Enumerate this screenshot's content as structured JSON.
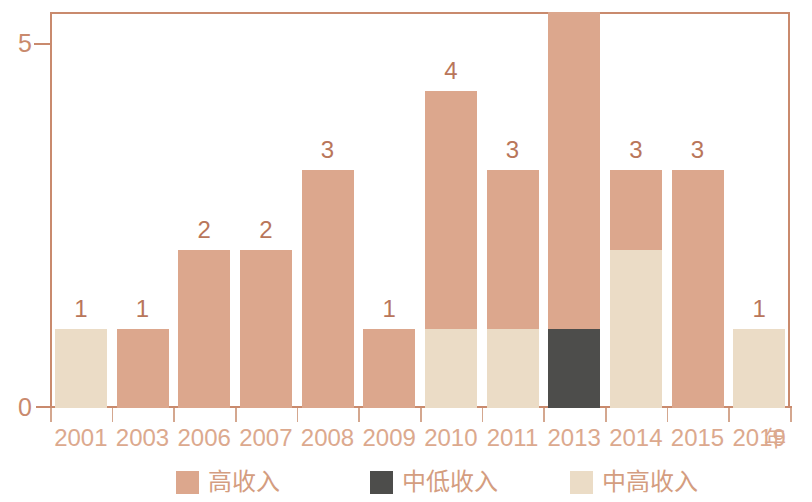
{
  "chart_data": {
    "type": "bar",
    "subtype": "stacked-bar",
    "title": "",
    "xlabel": "年",
    "ylabel": "",
    "ylim": [
      0,
      5
    ],
    "yticks": [
      "0",
      "5"
    ],
    "grid": false,
    "legend_position": "bottom",
    "categories": [
      "2001",
      "2003",
      "2006",
      "2007",
      "2008",
      "2009",
      "2010",
      "2011",
      "2013",
      "2014",
      "2015",
      "2019"
    ],
    "totals": [
      1,
      1,
      2,
      2,
      3,
      1,
      4,
      3,
      5,
      3,
      3,
      1
    ],
    "series": [
      {
        "name": "中低收入",
        "color": "#4d4d4b",
        "values": [
          0,
          0,
          0,
          0,
          0,
          0,
          0,
          0,
          1,
          0,
          0,
          0
        ]
      },
      {
        "name": "中高收入",
        "color": "#ebdcc6",
        "values": [
          1,
          0,
          0,
          0,
          0,
          0,
          1,
          1,
          0,
          2,
          0,
          1
        ]
      },
      {
        "name": "高收入",
        "color": "#dca78d",
        "values": [
          0,
          1,
          2,
          2,
          3,
          1,
          3,
          2,
          4,
          1,
          3,
          0
        ]
      }
    ],
    "stack_order_bottom_to_top": [
      "中低收入",
      "中高收入",
      "高收入"
    ],
    "data_labels": [
      "1",
      "1",
      "2",
      "2",
      "3",
      "1",
      "4",
      "3",
      "5",
      "3",
      "3",
      "1"
    ],
    "axis_color": "#c98a6d",
    "label_color": "#dca98e"
  },
  "legend": {
    "items": [
      {
        "label": "高收入",
        "color": "#dca78d"
      },
      {
        "label": "中低收入",
        "color": "#4d4d4b"
      },
      {
        "label": "中高收入",
        "color": "#ebdcc6"
      }
    ]
  },
  "axis": {
    "y_ticks": [
      {
        "value": "5"
      },
      {
        "value": "0"
      }
    ],
    "x_unit": "年"
  }
}
